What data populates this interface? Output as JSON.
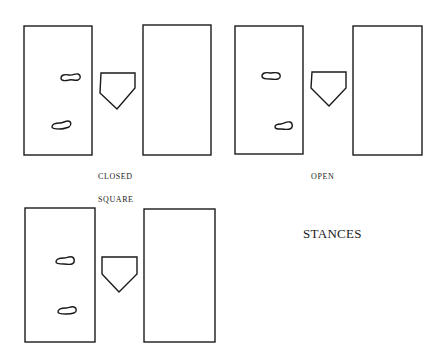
{
  "title": "STANCES",
  "diagrams": [
    {
      "name": "closed",
      "label": "CLOSED"
    },
    {
      "name": "open",
      "label": "OPEN"
    },
    {
      "name": "square",
      "label": "SQUARE"
    }
  ],
  "colors": {
    "stroke": "#1a1a1a",
    "background": "#ffffff"
  }
}
